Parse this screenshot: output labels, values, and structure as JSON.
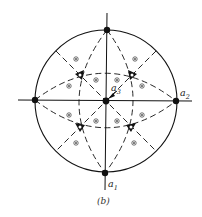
{
  "figure": {
    "caption": "(b)",
    "type": "stereographic-projection",
    "axes": {
      "a1": {
        "label_main": "a",
        "label_sub": "1"
      },
      "a2": {
        "label_main": "a",
        "label_sub": "2"
      },
      "a3": {
        "label_main": "a",
        "label_sub": "3"
      }
    },
    "colors": {
      "ink": "#111111",
      "background": "#ffffff"
    },
    "symbols": {
      "poles_fourfold": 5,
      "threefold_triangles": 4,
      "general_positions": 12
    }
  }
}
